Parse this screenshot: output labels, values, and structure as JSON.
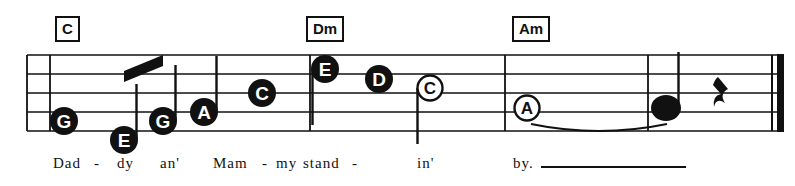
{
  "sheet": {
    "width": 795,
    "height": 186,
    "background": "#ffffff",
    "ink_color": "#111111"
  },
  "chords": [
    {
      "label": "C",
      "x": 55,
      "y": 16
    },
    {
      "label": "Dm",
      "x": 306,
      "y": 16
    },
    {
      "label": "Am",
      "x": 512,
      "y": 16
    }
  ],
  "lyrics": {
    "words": [
      {
        "text": "Dad",
        "x": 53,
        "y": 155
      },
      {
        "text": "-",
        "x": 94,
        "y": 155
      },
      {
        "text": "dy",
        "x": 117,
        "y": 155
      },
      {
        "text": "an'",
        "x": 160,
        "y": 155
      },
      {
        "text": "Mam",
        "x": 213,
        "y": 155
      },
      {
        "text": "-",
        "x": 262,
        "y": 155
      },
      {
        "text": "my",
        "x": 276,
        "y": 155
      },
      {
        "text": "stand",
        "x": 303,
        "y": 155
      },
      {
        "text": "-",
        "x": 352,
        "y": 155
      },
      {
        "text": "in'",
        "x": 417,
        "y": 155
      },
      {
        "text": "by.",
        "x": 513,
        "y": 155
      }
    ],
    "extender": {
      "x": 541,
      "y": 166,
      "width": 145
    }
  },
  "chart_data": {
    "type": "music-staff",
    "staff": {
      "line_count": 5,
      "top_y": 55,
      "line_spacing": 19,
      "left_x": 27,
      "right_x": 783
    },
    "barlines": [
      {
        "x": 27,
        "kind": "single"
      },
      {
        "x": 50,
        "kind": "single"
      },
      {
        "x": 310,
        "kind": "single"
      },
      {
        "x": 505,
        "kind": "single"
      },
      {
        "x": 648,
        "kind": "single"
      },
      {
        "x": 772,
        "kind": "final-thin-thick"
      }
    ],
    "notes": [
      {
        "letter": "G",
        "x": 64,
        "y": 121,
        "head": "filled",
        "stem": "none",
        "beam_group": null,
        "tie": null
      },
      {
        "letter": "E",
        "x": 124,
        "y": 140,
        "head": "filled",
        "stem": "up",
        "beam_group": 1,
        "tie": null
      },
      {
        "letter": "G",
        "x": 163,
        "y": 121,
        "head": "filled",
        "stem": "up",
        "beam_group": 1,
        "tie": null
      },
      {
        "letter": "A",
        "x": 204,
        "y": 112,
        "head": "filled",
        "stem": "up",
        "beam_group": null,
        "tie": null
      },
      {
        "letter": "C",
        "x": 262,
        "y": 93,
        "head": "filled",
        "stem": "none",
        "beam_group": null,
        "tie": null
      },
      {
        "letter": "E",
        "x": 325,
        "y": 69,
        "head": "filled",
        "stem": "down",
        "beam_group": null,
        "tie": null
      },
      {
        "letter": "D",
        "x": 379,
        "y": 79,
        "head": "filled",
        "stem": "none",
        "beam_group": null,
        "tie": null
      },
      {
        "letter": "C",
        "x": 430,
        "y": 88,
        "head": "open",
        "stem": "down",
        "beam_group": null,
        "tie": null
      },
      {
        "letter": "A",
        "x": 527,
        "y": 108,
        "head": "open",
        "stem": "none",
        "beam_group": null,
        "tie": "start"
      },
      {
        "letter": "",
        "x": 666,
        "y": 108,
        "head": "filled-plain",
        "stem": "up",
        "beam_group": null,
        "tie": "end"
      }
    ],
    "beams": [
      {
        "group": 1,
        "x1": 124,
        "y1": 71,
        "x2": 163,
        "y2": 55,
        "thickness": 11
      }
    ],
    "ties": [
      {
        "from_x": 531,
        "to_x": 667,
        "y": 124,
        "bulge": 14
      }
    ],
    "rests": [
      {
        "type": "quarter",
        "x": 722,
        "y": 93
      }
    ]
  }
}
